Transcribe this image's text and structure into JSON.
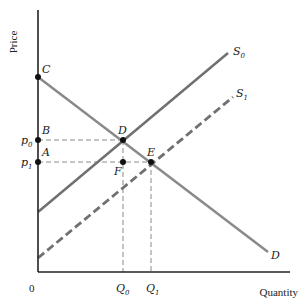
{
  "diagram": {
    "type": "supply-demand",
    "axes": {
      "y_label": "Price",
      "x_label": "Quantity",
      "origin_label": "0"
    },
    "price_ticks": [
      {
        "label": "p",
        "sub": "0",
        "y": 140
      },
      {
        "label": "p",
        "sub": "1",
        "y": 162
      }
    ],
    "quantity_ticks": [
      {
        "label": "Q",
        "sub": "0",
        "x": 123
      },
      {
        "label": "Q",
        "sub": "1",
        "x": 151
      }
    ],
    "curves": [
      {
        "name": "S",
        "sub": "0",
        "style": "solid",
        "from": [
          38,
          212
        ],
        "to": [
          228,
          53
        ],
        "color": "#707070"
      },
      {
        "name": "S",
        "sub": "1",
        "style": "dashed",
        "from": [
          38,
          258
        ],
        "to": [
          233,
          97
        ],
        "color": "#707070"
      },
      {
        "name": "D",
        "sub": "",
        "style": "solid",
        "from": [
          38,
          77
        ],
        "to": [
          268,
          252
        ],
        "color": "#8a8a8a"
      }
    ],
    "points": [
      {
        "label": "C",
        "x": 38,
        "y": 77
      },
      {
        "label": "B",
        "x": 38,
        "y": 140
      },
      {
        "label": "A",
        "x": 38,
        "y": 162
      },
      {
        "label": "D",
        "x": 123,
        "y": 140
      },
      {
        "label": "F",
        "x": 123,
        "y": 162
      },
      {
        "label": "E",
        "x": 151,
        "y": 162
      }
    ],
    "colors": {
      "axis": "#222222",
      "supply": "#707070",
      "demand": "#8a8a8a",
      "guide": "#888888",
      "point": "#111111"
    }
  },
  "labels": {
    "price": "Price",
    "quantity": "Quantity",
    "origin": "0",
    "C": "C",
    "B": "B",
    "A": "A",
    "D_point": "D",
    "F": "F",
    "E": "E",
    "p": "p",
    "p0_sub": "0",
    "p1_sub": "1",
    "Q": "Q",
    "Q0_sub": "0",
    "Q1_sub": "1",
    "S": "S",
    "S0_sub": "0",
    "S1_sub": "1",
    "D_curve": "D"
  }
}
